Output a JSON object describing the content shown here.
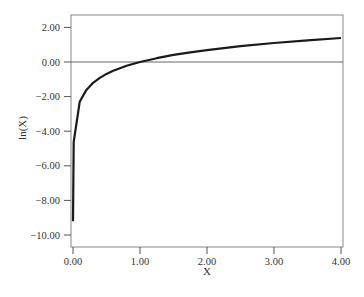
{
  "chart_data": {
    "type": "line",
    "title": "",
    "xlabel": "X",
    "ylabel": "ln(X)",
    "xlim": [
      0,
      4
    ],
    "ylim": [
      -10.6,
      2.7
    ],
    "x_ticks": [
      "0.00",
      "1.00",
      "2.00",
      "3.00",
      "4.00"
    ],
    "y_ticks": [
      "2.00",
      "0.00",
      "-2.00",
      "-4.00",
      "-6.00",
      "-8.00",
      "-10.00"
    ],
    "grid": false,
    "legend": null,
    "reference_line": {
      "y": 0
    },
    "series": [
      {
        "name": "ln(X)",
        "x": [
          0.0001,
          0.01,
          0.1,
          0.2,
          0.3,
          0.4,
          0.5,
          0.6,
          0.8,
          1.0,
          1.25,
          1.5,
          1.75,
          2.0,
          2.5,
          3.0,
          3.5,
          4.0
        ],
        "values": [
          -9.21,
          -4.61,
          -2.3,
          -1.61,
          -1.2,
          -0.92,
          -0.69,
          -0.51,
          -0.22,
          0.0,
          0.22,
          0.41,
          0.56,
          0.69,
          0.92,
          1.1,
          1.25,
          1.39
        ]
      }
    ],
    "colors": {
      "line": "#1a1a1a",
      "axis": "#555555",
      "zero_line": "#555555"
    }
  }
}
